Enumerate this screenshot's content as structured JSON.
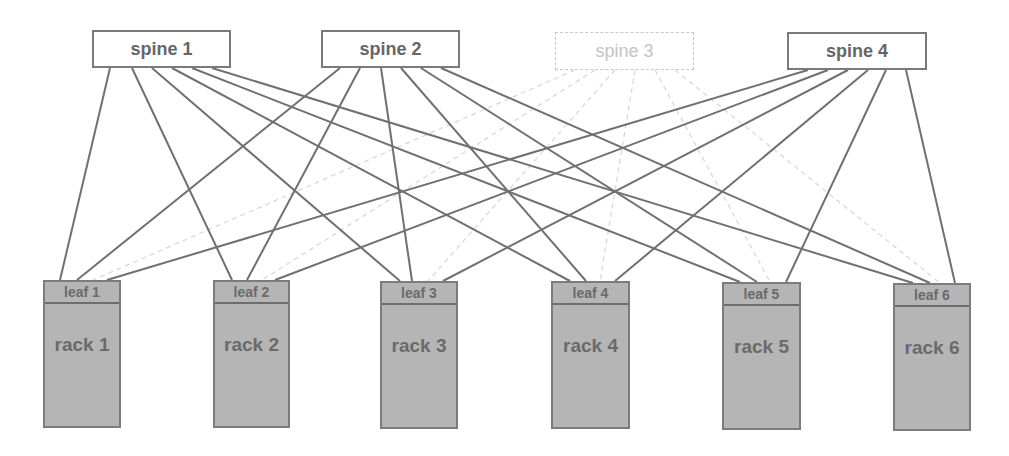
{
  "diagram": {
    "title": "",
    "colors": {
      "link": "#707070",
      "inactive_link": "#d6d6d6",
      "rack_fill": "#b5b5b5",
      "rack_border": "#7c7c7c",
      "text": "#6a6a6a",
      "inactive_text": "#c4c4c4"
    },
    "spines": [
      {
        "label": "spine 1",
        "active": true,
        "x": 92,
        "y": 30,
        "w": 139,
        "h": 38
      },
      {
        "label": "spine 2",
        "active": true,
        "x": 321,
        "y": 30,
        "w": 139,
        "h": 38
      },
      {
        "label": "spine 3",
        "active": false,
        "x": 555,
        "y": 32,
        "w": 139,
        "h": 38
      },
      {
        "label": "spine 4",
        "active": true,
        "x": 787,
        "y": 32,
        "w": 140,
        "h": 38
      }
    ],
    "racks": [
      {
        "leaf": "leaf 1",
        "label": "rack 1",
        "x": 43,
        "y": 280,
        "w": 78,
        "h": 148
      },
      {
        "leaf": "leaf 2",
        "label": "rack 2",
        "x": 213,
        "y": 280,
        "w": 77,
        "h": 148
      },
      {
        "leaf": "leaf 3",
        "label": "rack 3",
        "x": 380,
        "y": 281,
        "w": 78,
        "h": 148
      },
      {
        "leaf": "leaf 4",
        "label": "rack 4",
        "x": 551,
        "y": 281,
        "w": 79,
        "h": 148
      },
      {
        "leaf": "leaf 5",
        "label": "rack 5",
        "x": 722,
        "y": 282,
        "w": 79,
        "h": 148
      },
      {
        "leaf": "leaf 6",
        "label": "rack 6",
        "x": 893,
        "y": 283,
        "w": 78,
        "h": 148
      }
    ],
    "links": [
      {
        "from": 0,
        "to": 0,
        "x1": 110,
        "y1": 68,
        "x2": 60,
        "y2": 280,
        "active": true
      },
      {
        "from": 0,
        "to": 1,
        "x1": 132,
        "y1": 68,
        "x2": 232,
        "y2": 280,
        "active": true
      },
      {
        "from": 0,
        "to": 2,
        "x1": 152,
        "y1": 68,
        "x2": 400,
        "y2": 281,
        "active": true
      },
      {
        "from": 0,
        "to": 3,
        "x1": 172,
        "y1": 68,
        "x2": 570,
        "y2": 281,
        "active": true
      },
      {
        "from": 0,
        "to": 4,
        "x1": 192,
        "y1": 68,
        "x2": 740,
        "y2": 282,
        "active": true
      },
      {
        "from": 0,
        "to": 5,
        "x1": 212,
        "y1": 68,
        "x2": 913,
        "y2": 283,
        "active": true
      },
      {
        "from": 1,
        "to": 0,
        "x1": 340,
        "y1": 68,
        "x2": 77,
        "y2": 280,
        "active": true
      },
      {
        "from": 1,
        "to": 1,
        "x1": 360,
        "y1": 68,
        "x2": 247,
        "y2": 280,
        "active": true
      },
      {
        "from": 1,
        "to": 2,
        "x1": 381,
        "y1": 68,
        "x2": 412,
        "y2": 281,
        "active": true
      },
      {
        "from": 1,
        "to": 3,
        "x1": 401,
        "y1": 68,
        "x2": 586,
        "y2": 281,
        "active": true
      },
      {
        "from": 1,
        "to": 4,
        "x1": 421,
        "y1": 68,
        "x2": 757,
        "y2": 282,
        "active": true
      },
      {
        "from": 1,
        "to": 5,
        "x1": 441,
        "y1": 68,
        "x2": 930,
        "y2": 283,
        "active": true
      },
      {
        "from": 2,
        "to": 0,
        "x1": 575,
        "y1": 70,
        "x2": 93,
        "y2": 280,
        "active": false
      },
      {
        "from": 2,
        "to": 1,
        "x1": 595,
        "y1": 70,
        "x2": 262,
        "y2": 280,
        "active": false
      },
      {
        "from": 2,
        "to": 2,
        "x1": 615,
        "y1": 70,
        "x2": 428,
        "y2": 281,
        "active": false
      },
      {
        "from": 2,
        "to": 3,
        "x1": 635,
        "y1": 70,
        "x2": 600,
        "y2": 281,
        "active": false
      },
      {
        "from": 2,
        "to": 4,
        "x1": 655,
        "y1": 70,
        "x2": 770,
        "y2": 282,
        "active": false
      },
      {
        "from": 2,
        "to": 5,
        "x1": 675,
        "y1": 70,
        "x2": 940,
        "y2": 283,
        "active": false
      },
      {
        "from": 3,
        "to": 0,
        "x1": 808,
        "y1": 70,
        "x2": 107,
        "y2": 280,
        "active": true
      },
      {
        "from": 3,
        "to": 1,
        "x1": 828,
        "y1": 70,
        "x2": 275,
        "y2": 280,
        "active": true
      },
      {
        "from": 3,
        "to": 2,
        "x1": 848,
        "y1": 70,
        "x2": 443,
        "y2": 281,
        "active": true
      },
      {
        "from": 3,
        "to": 3,
        "x1": 868,
        "y1": 70,
        "x2": 615,
        "y2": 281,
        "active": true
      },
      {
        "from": 3,
        "to": 4,
        "x1": 886,
        "y1": 70,
        "x2": 786,
        "y2": 282,
        "active": true
      },
      {
        "from": 3,
        "to": 5,
        "x1": 906,
        "y1": 70,
        "x2": 955,
        "y2": 283,
        "active": true
      }
    ]
  }
}
